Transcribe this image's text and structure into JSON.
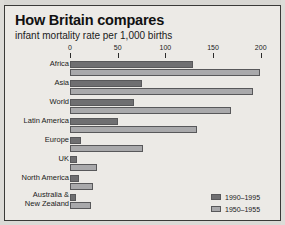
{
  "chart_data": {
    "type": "bar",
    "orientation": "horizontal",
    "title": "How Britain compares",
    "subtitle": "infant mortality rate per 1,000 births",
    "xlabel": "",
    "ylabel": "",
    "xlim": [
      0,
      215
    ],
    "ticks": [
      0,
      50,
      100,
      150,
      200
    ],
    "tick_labels": [
      "0",
      "50",
      "100",
      "150",
      "200"
    ],
    "grid": false,
    "legend_position": "bottom-right",
    "categories": [
      "Africa",
      "Asia",
      "World",
      "Latin America",
      "Europe",
      "UK",
      "North America",
      "Australia &\nNew Zealand"
    ],
    "series": [
      {
        "name": "1990–1995",
        "color": "#6f6f71",
        "values": [
          129,
          76,
          67,
          50,
          12,
          7,
          9,
          6
        ]
      },
      {
        "name": "1950–1955",
        "color": "#a9a9ab",
        "values": [
          199,
          192,
          169,
          133,
          77,
          28,
          24,
          22
        ]
      }
    ]
  },
  "categories_display": [
    {
      "line1": "Africa",
      "line2": ""
    },
    {
      "line1": "Asia",
      "line2": ""
    },
    {
      "line1": "World",
      "line2": ""
    },
    {
      "line1": "Latin America",
      "line2": ""
    },
    {
      "line1": "Europe",
      "line2": ""
    },
    {
      "line1": "UK",
      "line2": ""
    },
    {
      "line1": "North America",
      "line2": ""
    },
    {
      "line1": "Australia &",
      "line2": "New Zealand"
    }
  ],
  "colors": {
    "panel_background": "#eceae6",
    "frame": "#3a3a38",
    "series_recent": "#6f6f71",
    "series_historic": "#a9a9ab",
    "text": "#1a1a1a"
  }
}
